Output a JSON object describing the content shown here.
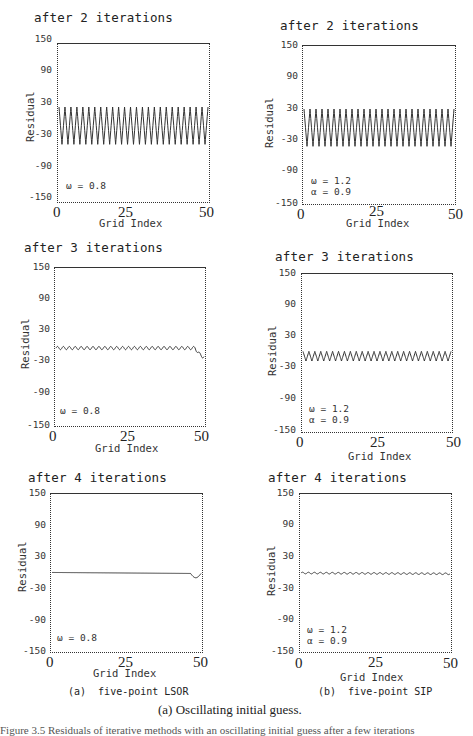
{
  "chart_data": [
    {
      "type": "line",
      "panel": "a",
      "method": "five-point LSOR",
      "title": "after 2 iterations",
      "xlabel": "Grid Index",
      "ylabel": "Residual",
      "xlim": [
        0,
        50
      ],
      "ylim": [
        -150,
        150
      ],
      "xticks": [
        "0",
        "25",
        "50"
      ],
      "yticks": [
        "150",
        "90",
        "30",
        "-30",
        "-90",
        "-150"
      ],
      "params": [
        "ω = 0.8"
      ],
      "series": [
        {
          "name": "residual",
          "description": "sawtooth oscillation between about +30 and -40, ~25 periods",
          "amplitude_max": 30,
          "amplitude_min": -40,
          "periods": 25
        }
      ],
      "grid": false
    },
    {
      "type": "line",
      "panel": "b",
      "method": "five-point SIP",
      "title": "after 2 iterations",
      "xlabel": "Grid Index",
      "ylabel": "Residual",
      "xlim": [
        0,
        50
      ],
      "ylim": [
        -150,
        150
      ],
      "xticks": [
        "0",
        "25",
        "50"
      ],
      "yticks": [
        "150",
        "90",
        "30",
        "-30",
        "-90",
        "-150"
      ],
      "params": [
        "ω = 1.2",
        "α = 0.9"
      ],
      "series": [
        {
          "name": "residual",
          "description": "sawtooth oscillation between about +30 and -40, ~25 periods",
          "amplitude_max": 30,
          "amplitude_min": -40,
          "periods": 25
        }
      ],
      "grid": false
    },
    {
      "type": "line",
      "panel": "a",
      "method": "five-point LSOR",
      "title": "after 3 iterations",
      "xlabel": "Grid Index",
      "ylabel": "Residual",
      "xlim": [
        0,
        50
      ],
      "ylim": [
        -150,
        150
      ],
      "xticks": [
        "0",
        "25",
        "50"
      ],
      "yticks": [
        "150",
        "90",
        "30",
        "-30",
        "-90",
        "-150"
      ],
      "params": [
        "ω = 0.8"
      ],
      "series": [
        {
          "name": "residual",
          "description": "small ripple near 0 (about -3 to 0), dips to about -18 at grid index 50",
          "center": -2,
          "ripple": 3,
          "end_dip": -18
        }
      ],
      "grid": false
    },
    {
      "type": "line",
      "panel": "b",
      "method": "five-point SIP",
      "title": "after 3 iterations",
      "xlabel": "Grid Index",
      "ylabel": "Residual",
      "xlim": [
        0,
        50
      ],
      "ylim": [
        -150,
        150
      ],
      "xticks": [
        "0",
        "25",
        "50"
      ],
      "yticks": [
        "150",
        "90",
        "30",
        "-30",
        "-90",
        "-150"
      ],
      "params": [
        "ω = 1.2",
        "α = 0.9"
      ],
      "series": [
        {
          "name": "residual",
          "description": "zigzag oscillation between about -15 and +3, ~25 periods",
          "amplitude_max": 3,
          "amplitude_min": -15,
          "periods": 25
        }
      ],
      "grid": false
    },
    {
      "type": "line",
      "panel": "a",
      "method": "five-point LSOR",
      "title": "after 4 iterations",
      "xlabel": "Grid Index",
      "ylabel": "Residual",
      "xlim": [
        0,
        50
      ],
      "ylim": [
        -150,
        150
      ],
      "xticks": [
        "0",
        "25",
        "50"
      ],
      "yticks": [
        "150",
        "90",
        "30",
        "-30",
        "-90",
        "-150"
      ],
      "params": [
        "ω = 0.8"
      ],
      "series": [
        {
          "name": "residual",
          "description": "nearly flat at about 0, slight dip to about -8 near grid index 48-50",
          "center": 0,
          "end_dip": -8
        }
      ],
      "grid": false
    },
    {
      "type": "line",
      "panel": "b",
      "method": "five-point SIP",
      "title": "after 4 iterations",
      "xlabel": "Grid Index",
      "ylabel": "Residual",
      "xlim": [
        0,
        50
      ],
      "ylim": [
        -150,
        150
      ],
      "xticks": [
        "0",
        "25",
        "50"
      ],
      "yticks": [
        "150",
        "90",
        "30",
        "-30",
        "-90",
        "-150"
      ],
      "params": [
        "ω = 1.2",
        "α = 0.9"
      ],
      "series": [
        {
          "name": "residual",
          "description": "nearly flat with tiny ripple around 0 to -3",
          "center": -1,
          "ripple": 1.5
        },
        {
          "name": "_",
          "description": ""
        }
      ],
      "grid": false
    }
  ],
  "panels": [
    {
      "title": "after 2 iterations",
      "ylabel": "Residual",
      "xlabel": "Grid Index",
      "yticks": [
        "150",
        "90",
        "30",
        "-30",
        "-90",
        "-150"
      ],
      "xticks": [
        "0",
        "25",
        "50"
      ],
      "param1": "ω = 0.8",
      "param2": ""
    },
    {
      "title": "after 2 iterations",
      "ylabel": "Residual",
      "xlabel": "Grid Index",
      "yticks": [
        "150",
        "90",
        "30",
        "-30",
        "-90",
        "-150"
      ],
      "xticks": [
        "0",
        "25",
        "50"
      ],
      "param1": "ω = 1.2",
      "param2": "α = 0.9"
    },
    {
      "title": "after 3 iterations",
      "ylabel": "Residual",
      "xlabel": "Grid Index",
      "yticks": [
        "150",
        "90",
        "30",
        "-30",
        "-90",
        "-150"
      ],
      "xticks": [
        "0",
        "25",
        "50"
      ],
      "param1": "ω = 0.8",
      "param2": ""
    },
    {
      "title": "after 3 iterations",
      "ylabel": "Residual",
      "xlabel": "Grid Index",
      "yticks": [
        "150",
        "90",
        "30",
        "-30",
        "-90",
        "-150"
      ],
      "xticks": [
        "0",
        "25",
        "50"
      ],
      "param1": "ω = 1.2",
      "param2": "α = 0.9"
    },
    {
      "title": "after 4 iterations",
      "ylabel": "Residual",
      "xlabel": "Grid Index",
      "yticks": [
        "150",
        "90",
        "30",
        "-30",
        "-90",
        "-150"
      ],
      "xticks": [
        "0",
        "25",
        "50"
      ],
      "param1": "ω = 0.8",
      "param2": ""
    },
    {
      "title": "after 4 iterations",
      "ylabel": "Residual",
      "xlabel": "Grid Index",
      "yticks": [
        "150",
        "90",
        "30",
        "-30",
        "-90",
        "-150"
      ],
      "xticks": [
        "0",
        "25",
        "50"
      ],
      "param1": "ω = 1.2",
      "param2": "α = 0.9"
    }
  ],
  "subcaptions": {
    "left": "(a)  five-point LSOR",
    "right": "(b)  five-point SIP"
  },
  "caption": "(a) Oscillating initial guess.",
  "truncated_text": "Figure 3.5  Residuals of iterative methods with an oscillating initial guess after a few iterations"
}
